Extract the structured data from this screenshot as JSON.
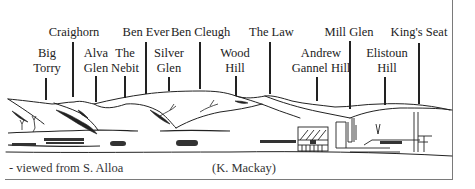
{
  "figure": {
    "labels": [
      {
        "id": "big-torry",
        "line1": "Big",
        "line2": "Torry"
      },
      {
        "id": "craighorn",
        "line1": "Craighorn",
        "line2": ""
      },
      {
        "id": "alva-glen",
        "line1": "Alva",
        "line2": "Glen"
      },
      {
        "id": "the-nebit",
        "line1": "The",
        "line2": "Nebit"
      },
      {
        "id": "ben-ever",
        "line1": "Ben Ever",
        "line2": ""
      },
      {
        "id": "silver-glen",
        "line1": "Silver",
        "line2": "Glen"
      },
      {
        "id": "ben-cleugh",
        "line1": "Ben Cleugh",
        "line2": ""
      },
      {
        "id": "wood-hill",
        "line1": "Wood",
        "line2": "Hill"
      },
      {
        "id": "the-law",
        "line1": "The Law",
        "line2": ""
      },
      {
        "id": "andrew-gannel-hill",
        "line1": "Andrew",
        "line2": "Gannel Hill"
      },
      {
        "id": "mill-glen",
        "line1": "Mill Glen",
        "line2": ""
      },
      {
        "id": "elistoun-hill",
        "line1": "Elistoun",
        "line2": "Hill"
      },
      {
        "id": "kings-seat",
        "line1": "King's Seat",
        "line2": ""
      }
    ],
    "caption_left": "- viewed from S. Alloa",
    "caption_right": "(K. Mackay)"
  }
}
